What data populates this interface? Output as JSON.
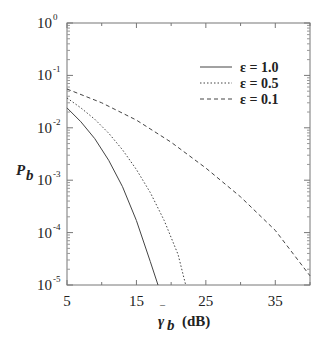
{
  "chart_data": {
    "type": "line",
    "title": "",
    "xlabel": "γ̄_b (dB)",
    "ylabel": "P_b",
    "xlim": [
      5,
      40
    ],
    "ylim": [
      1e-05,
      1
    ],
    "yscale": "log",
    "grid": false,
    "legend_position": "upper right",
    "x_ticks": [
      5,
      15,
      25,
      35
    ],
    "y_ticks": [
      {
        "value": 1,
        "base": "10",
        "exp": "0"
      },
      {
        "value": 0.1,
        "base": "10",
        "exp": "-1"
      },
      {
        "value": 0.01,
        "base": "10",
        "exp": "-2"
      },
      {
        "value": 0.001,
        "base": "10",
        "exp": "-3"
      },
      {
        "value": 0.0001,
        "base": "10",
        "exp": "-4"
      },
      {
        "value": 1e-05,
        "base": "10",
        "exp": "-5"
      }
    ],
    "series": [
      {
        "name": "ε = 1.0",
        "style": "solid",
        "x": [
          5,
          7,
          9,
          11,
          13,
          15,
          17,
          18.1
        ],
        "y": [
          0.024,
          0.013,
          0.0062,
          0.0024,
          0.00075,
          0.00017,
          2.8e-05,
          1e-05
        ]
      },
      {
        "name": "ε = 0.5",
        "style": "dotted",
        "x": [
          5,
          7,
          9,
          11,
          13,
          15,
          17,
          19,
          21,
          22.1
        ],
        "y": [
          0.037,
          0.024,
          0.0145,
          0.0079,
          0.0038,
          0.0016,
          0.00058,
          0.00017,
          3.8e-05,
          1e-05
        ]
      },
      {
        "name": "ε = 0.1",
        "style": "dashed",
        "x": [
          5,
          10,
          15,
          20,
          25,
          30,
          35,
          40
        ],
        "y": [
          0.055,
          0.03,
          0.014,
          0.0053,
          0.0017,
          0.00048,
          0.00011,
          1.5e-05
        ]
      }
    ]
  },
  "labels": {
    "ylabel_main": "P",
    "ylabel_sub": "b",
    "xlabel_main": "γ",
    "xlabel_sub": "b",
    "xlabel_unit": "(dB)"
  }
}
